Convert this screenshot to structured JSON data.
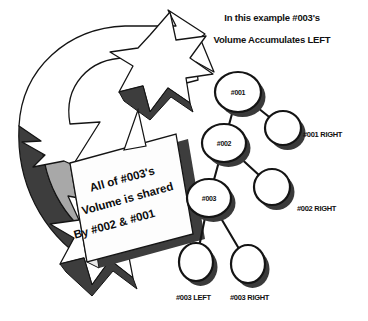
{
  "image": {
    "kind": "mlm-binary-tree-diagram",
    "width": 368,
    "height": 321,
    "background_color": "#ffffff"
  },
  "colors": {
    "stroke": "#141414",
    "text": "#111111",
    "node_fill": "#ffffff",
    "shadow": "#3a3a3a",
    "arrow_fill": "#ffffff",
    "arrow_shade": "#a8a8a8",
    "arrow_edge": "#3d3d3d",
    "callout_fill": "#fdfdfd",
    "callout_shade": "#cfcfcf"
  },
  "title": {
    "line1": "In this example #003's",
    "line2": "Volume Accumulates LEFT"
  },
  "callout": {
    "line1": "All of #003's",
    "line2": "Volume is shared",
    "line3": "By #002 & #001"
  },
  "arrow": {
    "name": "curved-volume-flow-arrow",
    "direction": "counter-clockwise-up-right"
  },
  "tree": {
    "nodes": [
      {
        "id": "n001",
        "label": "#001",
        "cx": 238,
        "cy": 92,
        "rx": 23,
        "ry": 20
      },
      {
        "id": "n001right",
        "label": "",
        "cx": 283,
        "cy": 128,
        "rx": 18,
        "ry": 17
      },
      {
        "id": "n002",
        "label": "#002",
        "cx": 224,
        "cy": 143,
        "rx": 22,
        "ry": 19
      },
      {
        "id": "n002right",
        "label": "",
        "cx": 272,
        "cy": 187,
        "rx": 18,
        "ry": 18
      },
      {
        "id": "n003",
        "label": "#003",
        "cx": 209,
        "cy": 198,
        "rx": 22,
        "ry": 19
      },
      {
        "id": "n003left",
        "label": "",
        "cx": 196,
        "cy": 262,
        "rx": 17,
        "ry": 19
      },
      {
        "id": "n003right",
        "label": "",
        "cx": 248,
        "cy": 264,
        "rx": 17,
        "ry": 19
      }
    ],
    "edges": [
      {
        "from": "n001",
        "to": "n001right"
      },
      {
        "from": "n001",
        "to": "n002"
      },
      {
        "from": "n002",
        "to": "n002right"
      },
      {
        "from": "n002",
        "to": "n003"
      },
      {
        "from": "n003",
        "to": "n003left"
      },
      {
        "from": "n003",
        "to": "n003right"
      }
    ],
    "labels": {
      "n001right": {
        "text": "#001 RIGHT",
        "x": 303,
        "y": 130
      },
      "n002right": {
        "text": "#002 RIGHT",
        "x": 297,
        "y": 204
      },
      "n003left": {
        "text": "#003 LEFT",
        "x": 176,
        "y": 293
      },
      "n003right": {
        "text": "#003 RIGHT",
        "x": 230,
        "y": 293
      }
    }
  }
}
